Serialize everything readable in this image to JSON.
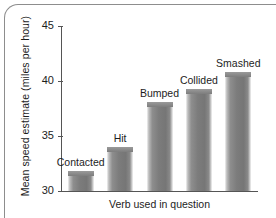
{
  "chart_data": {
    "type": "bar",
    "title": "",
    "xlabel": "Verb used in question",
    "ylabel": "Mean speed estimate (miles per hour)",
    "categories": [
      "Contacted",
      "Hit",
      "Bumped",
      "Collided",
      "Smashed"
    ],
    "values": [
      31.8,
      34.0,
      38.1,
      39.3,
      40.8
    ],
    "ylim": [
      30,
      45
    ],
    "yticks": [
      30,
      35,
      40,
      45
    ],
    "ytick_labels": [
      "30",
      "35",
      "40",
      "45"
    ],
    "grid": false,
    "legend": false,
    "bar_labels_position": "above-bar",
    "colors": {
      "bar_fill_dark": "#767676",
      "bar_fill_light": "#f2f2f2",
      "axis": "#555555",
      "text": "#1d1d1d",
      "frame": "#8d8d8d",
      "background": "#ffffff"
    }
  },
  "axis": {
    "y_title": "Mean speed estimate (miles per hour)",
    "x_title": "Verb used in question",
    "ticks": [
      {
        "label": "45",
        "value": 45
      },
      {
        "label": "40",
        "value": 40
      },
      {
        "label": "35",
        "value": 35
      },
      {
        "label": "30",
        "value": 30
      }
    ]
  },
  "bars": [
    {
      "label": "Contacted",
      "value": 31.8
    },
    {
      "label": "Hit",
      "value": 34.0
    },
    {
      "label": "Bumped",
      "value": 38.1
    },
    {
      "label": "Collided",
      "value": 39.3
    },
    {
      "label": "Smashed",
      "value": 40.8
    }
  ]
}
